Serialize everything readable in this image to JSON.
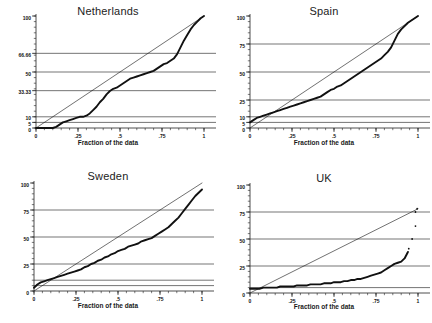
{
  "figure": {
    "xlabel": "Fraction of the data",
    "panel_layout": "2x2"
  },
  "panels": [
    {
      "title": "Netherlands",
      "xticks": [
        "0",
        ".25",
        ".5",
        ".75",
        "1"
      ],
      "yticks": [
        "0",
        "5",
        "10",
        "33.33",
        "50",
        "66.66",
        "100"
      ]
    },
    {
      "title": "Spain",
      "xticks": [
        "0",
        ".25",
        ".5",
        ".75",
        "1"
      ],
      "yticks": [
        "0",
        "5",
        "10",
        "25",
        "50",
        "75",
        "100"
      ]
    },
    {
      "title": "Sweden",
      "xticks": [
        "0",
        ".25",
        ".5",
        ".75",
        "1"
      ],
      "yticks": [
        "0",
        "25",
        "50",
        "75",
        "100"
      ]
    },
    {
      "title": "UK",
      "xticks": [
        "0",
        ".25",
        ".5",
        ".75",
        "1"
      ],
      "yticks": [
        "0",
        "25",
        "50",
        "75",
        "100"
      ]
    }
  ],
  "chart_data": [
    {
      "type": "line",
      "title": "Netherlands",
      "xlabel": "Fraction of the data",
      "ylabel": "",
      "xlim": [
        0,
        1
      ],
      "ylim": [
        0,
        100
      ],
      "grid": true,
      "gridlines_y": [
        5,
        10,
        33.33,
        50,
        66.66
      ],
      "xtick_values": [
        0,
        0.25,
        0.5,
        0.75,
        1
      ],
      "xtick_labels": [
        "0",
        ".25",
        ".5",
        ".75",
        "1"
      ],
      "ytick_values": [
        0,
        5,
        10,
        33.33,
        50,
        66.66,
        100
      ],
      "ytick_labels": [
        "0",
        "5",
        "10",
        "33.33",
        "50",
        "66.66",
        "100"
      ],
      "series": [
        {
          "name": "diagonal-reference",
          "style": "thin-line",
          "x": [
            0,
            1
          ],
          "values": [
            0,
            100
          ]
        },
        {
          "name": "cumulative-share",
          "style": "thick-step",
          "x": [
            0.0,
            0.02,
            0.04,
            0.06,
            0.08,
            0.1,
            0.12,
            0.14,
            0.16,
            0.18,
            0.2,
            0.22,
            0.24,
            0.26,
            0.28,
            0.3,
            0.32,
            0.34,
            0.36,
            0.38,
            0.4,
            0.42,
            0.44,
            0.46,
            0.48,
            0.5,
            0.52,
            0.54,
            0.56,
            0.58,
            0.6,
            0.62,
            0.64,
            0.66,
            0.68,
            0.7,
            0.72,
            0.74,
            0.76,
            0.78,
            0.8,
            0.82,
            0.84,
            0.86,
            0.88,
            0.9,
            0.92,
            0.94,
            0.96,
            0.98,
            1.0
          ],
          "values": [
            0,
            0,
            0,
            0,
            0,
            0,
            1,
            3,
            5,
            6,
            7,
            8,
            9,
            10,
            10,
            11,
            13,
            16,
            19,
            23,
            26,
            30,
            33,
            35,
            36,
            38,
            40,
            42,
            44,
            45,
            46,
            47,
            48,
            49,
            50,
            51,
            53,
            55,
            57,
            58,
            60,
            62,
            66,
            72,
            78,
            83,
            88,
            92,
            95,
            98,
            100
          ]
        }
      ]
    },
    {
      "type": "line",
      "title": "Spain",
      "xlabel": "Fraction of the data",
      "ylabel": "",
      "xlim": [
        0,
        1
      ],
      "ylim": [
        0,
        100
      ],
      "grid": true,
      "gridlines_y": [
        5,
        10,
        25,
        50,
        75
      ],
      "xtick_values": [
        0,
        0.25,
        0.5,
        0.75,
        1
      ],
      "xtick_labels": [
        "0",
        ".25",
        ".5",
        ".75",
        "1"
      ],
      "ytick_values": [
        0,
        5,
        10,
        25,
        50,
        75,
        100
      ],
      "ytick_labels": [
        "0",
        "5",
        "10",
        "25",
        "50",
        "75",
        "100"
      ],
      "series": [
        {
          "name": "diagonal-reference",
          "style": "thin-line",
          "x": [
            0,
            1
          ],
          "values": [
            0,
            100
          ]
        },
        {
          "name": "cumulative-share",
          "style": "thick-step",
          "x": [
            0.0,
            0.02,
            0.04,
            0.06,
            0.08,
            0.1,
            0.12,
            0.14,
            0.16,
            0.18,
            0.2,
            0.22,
            0.24,
            0.26,
            0.28,
            0.3,
            0.32,
            0.34,
            0.36,
            0.38,
            0.4,
            0.42,
            0.44,
            0.46,
            0.48,
            0.5,
            0.52,
            0.54,
            0.56,
            0.58,
            0.6,
            0.62,
            0.64,
            0.66,
            0.68,
            0.7,
            0.72,
            0.74,
            0.76,
            0.78,
            0.8,
            0.82,
            0.84,
            0.86,
            0.88,
            0.9,
            0.92,
            0.94,
            0.96,
            0.98,
            1.0
          ],
          "values": [
            5,
            7,
            9,
            10,
            11,
            12,
            13,
            14,
            15,
            16,
            17,
            18,
            19,
            20,
            21,
            22,
            23,
            24,
            25,
            26,
            27,
            28,
            30,
            32,
            34,
            35,
            37,
            38,
            40,
            42,
            44,
            46,
            48,
            50,
            52,
            54,
            56,
            58,
            60,
            62,
            65,
            68,
            72,
            78,
            84,
            88,
            91,
            94,
            96,
            98,
            100
          ]
        }
      ]
    },
    {
      "type": "line",
      "title": "Sweden",
      "xlabel": "Fraction of the data",
      "ylabel": "",
      "xlim": [
        0,
        1
      ],
      "ylim": [
        0,
        100
      ],
      "grid": true,
      "gridlines_y": [
        5,
        10,
        25,
        50,
        75
      ],
      "xtick_values": [
        0,
        0.25,
        0.5,
        0.75,
        1
      ],
      "xtick_labels": [
        "0",
        ".25",
        ".5",
        ".75",
        "1"
      ],
      "ytick_values": [
        0,
        25,
        50,
        75,
        100
      ],
      "ytick_labels": [
        "0",
        "25",
        "50",
        "75",
        "100"
      ],
      "series": [
        {
          "name": "diagonal-reference",
          "style": "thin-line",
          "x": [
            0,
            1
          ],
          "values": [
            0,
            100
          ]
        },
        {
          "name": "cumulative-share",
          "style": "thick-step",
          "x": [
            0.0,
            0.02,
            0.04,
            0.06,
            0.08,
            0.1,
            0.12,
            0.14,
            0.16,
            0.18,
            0.2,
            0.22,
            0.24,
            0.26,
            0.28,
            0.3,
            0.32,
            0.34,
            0.36,
            0.38,
            0.4,
            0.42,
            0.44,
            0.46,
            0.48,
            0.5,
            0.52,
            0.54,
            0.56,
            0.58,
            0.6,
            0.62,
            0.64,
            0.66,
            0.68,
            0.7,
            0.72,
            0.74,
            0.76,
            0.78,
            0.8,
            0.82,
            0.84,
            0.86,
            0.88,
            0.9,
            0.92,
            0.94,
            0.96,
            0.98,
            1.0
          ],
          "values": [
            3,
            6,
            8,
            9,
            10,
            11,
            12,
            13,
            14,
            15,
            16,
            17,
            18,
            19,
            20,
            22,
            23,
            25,
            26,
            28,
            29,
            31,
            32,
            34,
            35,
            37,
            38,
            39,
            41,
            42,
            43,
            44,
            46,
            47,
            48,
            49,
            51,
            53,
            55,
            57,
            59,
            62,
            65,
            68,
            72,
            76,
            80,
            84,
            88,
            91,
            94
          ]
        }
      ]
    },
    {
      "type": "line",
      "title": "UK",
      "xlabel": "Fraction of the data",
      "ylabel": "",
      "xlim": [
        0,
        1
      ],
      "ylim": [
        0,
        100
      ],
      "grid": true,
      "gridlines_y": [
        5,
        25,
        50,
        75
      ],
      "xtick_values": [
        0,
        0.25,
        0.5,
        0.75,
        1
      ],
      "xtick_labels": [
        "0",
        ".25",
        ".5",
        ".75",
        "1"
      ],
      "ytick_values": [
        0,
        25,
        50,
        75,
        100
      ],
      "ytick_labels": [
        "0",
        "25",
        "50",
        "75",
        "100"
      ],
      "series": [
        {
          "name": "diagonal-reference",
          "style": "thin-line",
          "x": [
            0,
            1
          ],
          "values": [
            0,
            78
          ]
        },
        {
          "name": "cumulative-share",
          "style": "thick-step",
          "x": [
            0.0,
            0.02,
            0.04,
            0.06,
            0.08,
            0.1,
            0.12,
            0.14,
            0.16,
            0.18,
            0.2,
            0.22,
            0.24,
            0.26,
            0.28,
            0.3,
            0.32,
            0.34,
            0.36,
            0.38,
            0.4,
            0.42,
            0.44,
            0.46,
            0.48,
            0.5,
            0.52,
            0.54,
            0.56,
            0.58,
            0.6,
            0.62,
            0.64,
            0.66,
            0.68,
            0.7,
            0.72,
            0.74,
            0.76,
            0.78,
            0.8,
            0.82,
            0.84,
            0.86,
            0.88,
            0.9,
            0.92,
            0.94
          ],
          "values": [
            4,
            4,
            4,
            4,
            5,
            5,
            5,
            5,
            5,
            6,
            6,
            6,
            6,
            6,
            7,
            7,
            7,
            7,
            8,
            8,
            8,
            8,
            9,
            9,
            9,
            10,
            10,
            10,
            11,
            11,
            12,
            12,
            13,
            13,
            14,
            15,
            16,
            17,
            18,
            19,
            21,
            23,
            25,
            27,
            28,
            29,
            32,
            38
          ]
        },
        {
          "name": "outliers",
          "style": "points",
          "x": [
            0.945,
            0.965,
            0.985,
            0.985,
            0.995
          ],
          "values": [
            41,
            50,
            62,
            75,
            78
          ]
        }
      ]
    }
  ]
}
